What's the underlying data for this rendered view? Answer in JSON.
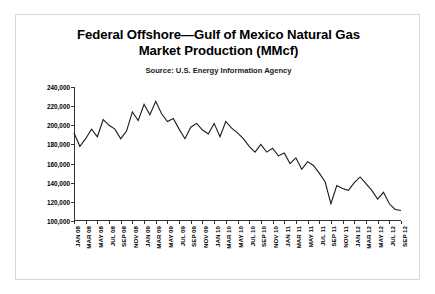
{
  "chart_data": {
    "type": "line",
    "title": "Federal Offshore—Gulf of Mexico Natural Gas Market Production (MMcf)",
    "title_line1": "Federal Offshore—Gulf of Mexico Natural Gas",
    "title_line2": "Market Production (MMcf)",
    "subtitle": "Source: U.S. Energy Information Agency",
    "xlabel": "",
    "ylabel": "",
    "ylim": [
      100000,
      240000
    ],
    "yticks": [
      100000,
      120000,
      140000,
      160000,
      180000,
      200000,
      220000,
      240000
    ],
    "ytick_labels": [
      "100,000",
      "120,000",
      "140,000",
      "160,000",
      "180,000",
      "200,000",
      "220,000",
      "240,000"
    ],
    "grid": false,
    "legend": "none",
    "line_color": "#1a1a1a",
    "xtick_labels": [
      "JAN 08",
      "MAR 08",
      "MAY 08",
      "JUL 08",
      "SEP 08",
      "NOV 08",
      "JAN 09",
      "MAR 09",
      "MAY 09",
      "JUL 09",
      "SEP 09",
      "NOV 09",
      "JAN 10",
      "MAR 10",
      "MAY 10",
      "JUL 10",
      "SEP 10",
      "NOV 10",
      "JAN 11",
      "MAR 11",
      "MAY 11",
      "JUL 11",
      "SEP 11",
      "NOV 11",
      "JAN 12",
      "MAR 12",
      "MAY 12",
      "JUL 12",
      "SEP 12"
    ],
    "x": [
      "JAN 08",
      "FEB 08",
      "MAR 08",
      "APR 08",
      "MAY 08",
      "JUN 08",
      "JUL 08",
      "AUG 08",
      "SEP 08",
      "OCT 08",
      "NOV 08",
      "DEC 08",
      "JAN 09",
      "FEB 09",
      "MAR 09",
      "APR 09",
      "MAY 09",
      "JUN 09",
      "JUL 09",
      "AUG 09",
      "SEP 09",
      "OCT 09",
      "NOV 09",
      "DEC 09",
      "JAN 10",
      "FEB 10",
      "MAR 10",
      "APR 10",
      "MAY 10",
      "JUN 10",
      "JUL 10",
      "AUG 10",
      "SEP 10",
      "OCT 10",
      "NOV 10",
      "DEC 10",
      "JAN 11",
      "FEB 11",
      "MAR 11",
      "APR 11",
      "MAY 11",
      "JUN 11",
      "JUL 11",
      "AUG 11",
      "SEP 11",
      "OCT 11",
      "NOV 11",
      "DEC 11",
      "JAN 12",
      "FEB 12",
      "MAR 12",
      "APR 12",
      "MAY 12",
      "JUN 12",
      "JUL 12",
      "AUG 12",
      "SEP 12"
    ],
    "values": [
      192000,
      178000,
      186000,
      196000,
      188000,
      206000,
      200000,
      196000,
      186000,
      194000,
      214000,
      205000,
      222000,
      211000,
      225000,
      212000,
      204000,
      207000,
      196000,
      186000,
      198000,
      202000,
      195000,
      191000,
      202000,
      188000,
      204000,
      197000,
      192000,
      186000,
      178000,
      172000,
      180000,
      172000,
      176000,
      168000,
      171000,
      160000,
      166000,
      154000,
      162000,
      158000,
      150000,
      141000,
      118000,
      137000,
      134000,
      132000,
      140000,
      146000,
      139000,
      132000,
      123000,
      130000,
      118000,
      112000,
      111000
    ],
    "series": [
      {
        "name": "Federal Offshore Gulf of Mexico Natural Gas Market Production",
        "unit": "MMcf",
        "values": [
          192000,
          178000,
          186000,
          196000,
          188000,
          206000,
          200000,
          196000,
          186000,
          194000,
          214000,
          205000,
          222000,
          211000,
          225000,
          212000,
          204000,
          207000,
          196000,
          186000,
          198000,
          202000,
          195000,
          191000,
          202000,
          188000,
          204000,
          197000,
          192000,
          186000,
          178000,
          172000,
          180000,
          172000,
          176000,
          168000,
          171000,
          160000,
          166000,
          154000,
          162000,
          158000,
          150000,
          141000,
          118000,
          137000,
          134000,
          132000,
          140000,
          146000,
          139000,
          132000,
          123000,
          130000,
          118000,
          112000,
          111000
        ]
      }
    ]
  }
}
